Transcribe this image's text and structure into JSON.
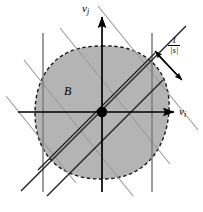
{
  "figure": {
    "name": "lattice-points-in-convex-body-diagram",
    "background_color": "#ffffff",
    "width": 203,
    "height": 212,
    "region": {
      "label": "B",
      "fill_color": "#b4b4b4",
      "border_color": "#1a1a1a",
      "border_style": "dashed",
      "center_x": 102,
      "center_y": 112,
      "radius_x": 67,
      "radius_y": 66
    },
    "center_point": {
      "name": "origin",
      "x": 102,
      "y": 112,
      "radius": 5,
      "color": "#000000"
    },
    "axes": {
      "x_label_base": "v",
      "x_label_sub": "i",
      "y_label_base": "v",
      "y_label_sub": "j",
      "color": "#000000"
    },
    "annotation": {
      "numerator": "1",
      "denominator": "|s|",
      "arrow_color": "#000000",
      "description": "spacing between adjacent lattice lines"
    },
    "line_families": [
      {
        "name": "vertical-lines",
        "color": "#808080",
        "count": 3,
        "x_positions": [
          43,
          102,
          152
        ]
      },
      {
        "name": "diagonal-up-lines-dark",
        "color": "#1a1a1a",
        "count": 3
      },
      {
        "name": "diagonal-down-lines-light",
        "color": "#9a9a9a",
        "count": 3
      }
    ]
  }
}
